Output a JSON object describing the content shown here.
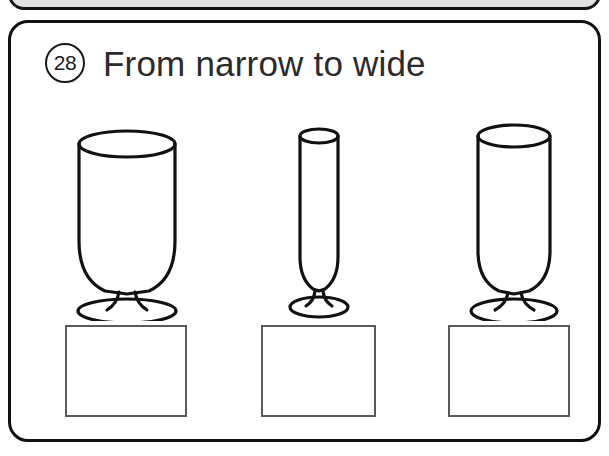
{
  "worksheet": {
    "exercise_number": "28",
    "title": "From narrow to wide",
    "instruction_type": "ordering",
    "prev_card": {
      "visible_portion": "bottom-edge-only",
      "fill_color": "#e2e2e2"
    },
    "card": {
      "border_color": "#111111",
      "background_color": "#ffffff",
      "corner_radius_px": 20
    },
    "items": [
      {
        "id": "glass-1",
        "name": "wide-glass",
        "description": "Wide goblet with rounded bowl and short stem on oval foot",
        "rim_width_relative": "wide",
        "order_position": 1,
        "answer": ""
      },
      {
        "id": "glass-2",
        "name": "narrow-glass",
        "description": "Very narrow tall flute with slim stem on small oval foot",
        "rim_width_relative": "narrow",
        "order_position": 2,
        "answer": ""
      },
      {
        "id": "glass-3",
        "name": "medium-glass",
        "description": "Medium width straight-sided glass with stem on oval foot",
        "rim_width_relative": "medium",
        "order_position": 3,
        "answer": ""
      }
    ],
    "answer_boxes": [
      {
        "id": "answer-box-1",
        "value": "",
        "for_item": "glass-1"
      },
      {
        "id": "answer-box-2",
        "value": "",
        "for_item": "glass-2"
      },
      {
        "id": "answer-box-3",
        "value": "",
        "for_item": "glass-3"
      }
    ],
    "colors": {
      "ink": "#111111",
      "text": "#2b2b2b",
      "box_border": "#5a5a5a",
      "paper": "#ffffff",
      "prev_card_fill": "#e2e2e2"
    }
  }
}
